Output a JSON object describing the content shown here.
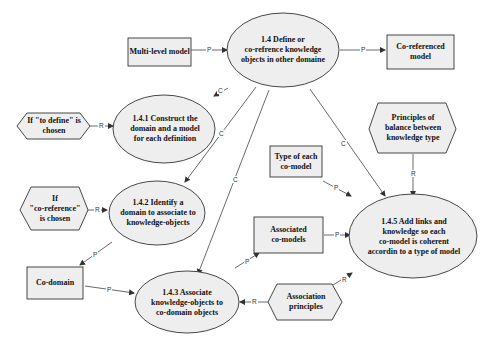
{
  "diagram": {
    "colors": {
      "fill": "#eeeeee",
      "stroke": "#333333",
      "background": "#ffffff"
    },
    "nodes": {
      "main": {
        "label": "1.4  Define or\nco-refrence knowledge\nobjects in other domaine",
        "shape": "ellipse"
      },
      "multi_level_model": {
        "label": "Multi-level model",
        "shape": "rectangle"
      },
      "co_referenced_model": {
        "label": "Co-referenced\nmodel",
        "shape": "rectangle"
      },
      "if_to_define": {
        "label": "If \"to define\" is\nchosen",
        "shape": "hexagon"
      },
      "step_1_4_1": {
        "label": "1.4.1 Construct the\ndomain and a model\nfor each definition",
        "shape": "ellipse"
      },
      "if_co_reference": {
        "label": "If\n\"co-reference\"\nis chosen",
        "shape": "hexagon"
      },
      "step_1_4_2": {
        "label": "1.4.2 Identify a\ndomain to associate to\nknowledge-objects",
        "shape": "ellipse"
      },
      "co_domain": {
        "label": "Co-domain",
        "shape": "rectangle"
      },
      "step_1_4_3": {
        "label": "1.4.3 Associate\nknowledge-objects to\nco-domain objects",
        "shape": "ellipse"
      },
      "type_of_each_co_model": {
        "label": "Type of each\nco-model",
        "shape": "rectangle"
      },
      "associated_co_models": {
        "label": "Associated\nco-models",
        "shape": "rectangle"
      },
      "principles_of_balance": {
        "label": "Principles of\nbalance between\nknowledge type",
        "shape": "hexagon"
      },
      "step_1_4_5": {
        "label": "1.4.5 Add links and\nknowledge so each\nco-model is coherent\naccordin to a type of model",
        "shape": "ellipse"
      },
      "association_principles": {
        "label": "Association\nprinciples",
        "shape": "hexagon"
      }
    },
    "edge_labels": {
      "p": "P",
      "r": "R",
      "c": "C"
    },
    "edges": [
      {
        "from": "multi_level_model",
        "to": "main",
        "label": "P"
      },
      {
        "from": "main",
        "to": "co_referenced_model",
        "label": "P"
      },
      {
        "from": "main",
        "to": "step_1_4_1",
        "label": "C"
      },
      {
        "from": "if_to_define",
        "to": "step_1_4_1",
        "label": "R"
      },
      {
        "from": "main",
        "to": "step_1_4_2",
        "label": "C"
      },
      {
        "from": "if_co_reference",
        "to": "step_1_4_2",
        "label": "R"
      },
      {
        "from": "step_1_4_2",
        "to": "co_domain",
        "label": "P"
      },
      {
        "from": "main",
        "to": "step_1_4_3",
        "label": "C"
      },
      {
        "from": "co_domain",
        "to": "step_1_4_3",
        "label": "P"
      },
      {
        "from": "association_principles",
        "to": "step_1_4_3",
        "label": "R"
      },
      {
        "from": "step_1_4_3",
        "to": "associated_co_models",
        "label": "P"
      },
      {
        "from": "main",
        "to": "step_1_4_5",
        "label": "C"
      },
      {
        "from": "type_of_each_co_model",
        "to": "step_1_4_5",
        "label": "P"
      },
      {
        "from": "associated_co_models",
        "to": "step_1_4_5",
        "label": "P"
      },
      {
        "from": "principles_of_balance",
        "to": "step_1_4_5",
        "label": "R"
      },
      {
        "from": "association_principles",
        "to": "step_1_4_5",
        "label": "R"
      }
    ]
  }
}
